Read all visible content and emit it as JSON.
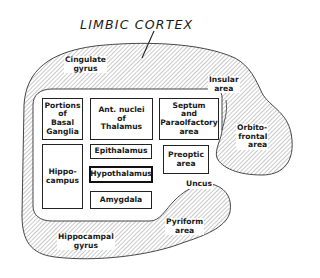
{
  "title": "LIMBIC CORTEX",
  "outer_regions": {
    "cingulate": "Cingulate\ngyrus",
    "insular": "Insular\narea",
    "orbitofrontal": "Orbito-\nfrontal\narea",
    "uncus": "Uncus",
    "pyriform": "Pyriform\narea",
    "hippocampal_gyrus": "Hippocampal\ngyrus"
  },
  "inner_structures": {
    "basal_ganglia": "Portions\nof\nBasal\nGanglia",
    "ant_nuclei": "Ant. nuclei\nof\nThalamus",
    "septum": "Septum\nand\nParaolfactory\narea",
    "hippocampus": "Hippo-\ncampus",
    "epithalamus": "Epithalamus",
    "hypothalamus": "Hypothalamus",
    "amygdala": "Amygdala",
    "preoptic": "Preoptic\narea"
  },
  "colors": {
    "line": "#222222",
    "hatch": "#8a8a8a",
    "background": "#ffffff"
  }
}
